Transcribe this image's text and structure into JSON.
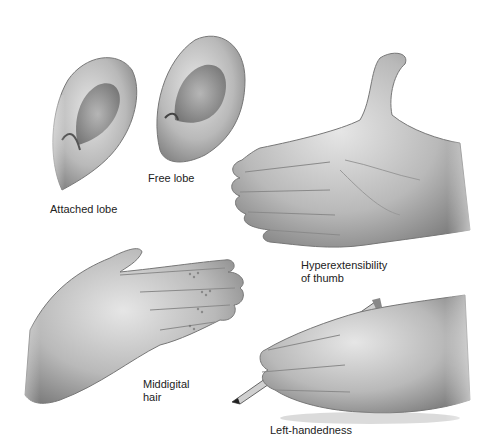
{
  "figure": {
    "background": "#ffffff",
    "ink_color": "#222222",
    "panels": [
      {
        "id": "attached-lobe",
        "label": "Attached lobe",
        "icon": "ear-attached-lobe-icon"
      },
      {
        "id": "free-lobe",
        "label": "Free lobe",
        "icon": "ear-free-lobe-icon"
      },
      {
        "id": "hyperextensibility",
        "label": "Hyperextensibility\nof thumb",
        "icon": "hand-hyperextended-thumb-icon"
      },
      {
        "id": "middigital-hair",
        "label": "Middigital\nhair",
        "icon": "hand-middigital-hair-icon"
      },
      {
        "id": "left-handedness",
        "label": "Left-handedness",
        "icon": "hand-writing-pencil-icon"
      }
    ]
  }
}
